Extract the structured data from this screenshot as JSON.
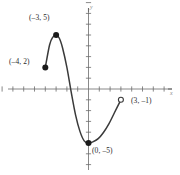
{
  "chart_data": {
    "type": "line",
    "title": "",
    "xlabel": "x",
    "ylabel": "y",
    "grid": false,
    "legend": null,
    "xlim": [
      -8,
      7
    ],
    "ylim": [
      -7,
      8
    ],
    "xticks": [
      -8,
      -7,
      -6,
      -5,
      -4,
      -3,
      -2,
      -1,
      0,
      1,
      2,
      3,
      4,
      5,
      6,
      7
    ],
    "yticks": [
      -7,
      -6,
      -5,
      -4,
      -3,
      -2,
      -1,
      0,
      1,
      2,
      3,
      4,
      5,
      6,
      7,
      8
    ],
    "tick_labels_shown": false,
    "curve_color": "#3a3a3a",
    "axis_color": "#6b6b6b",
    "domain": [
      -4,
      3
    ],
    "curve_points": [
      [
        -4.0,
        2.0
      ],
      [
        -3.6,
        4.1
      ],
      [
        -3.3,
        4.8
      ],
      [
        -3.0,
        5.0
      ],
      [
        -2.7,
        4.7
      ],
      [
        -2.4,
        3.8
      ],
      [
        -2.0,
        2.0
      ],
      [
        -1.6,
        -0.3
      ],
      [
        -1.2,
        -2.4
      ],
      [
        -0.8,
        -3.9
      ],
      [
        -0.4,
        -4.8
      ],
      [
        0.0,
        -5.0
      ],
      [
        0.4,
        -4.9
      ],
      [
        0.9,
        -4.6
      ],
      [
        1.4,
        -4.0
      ],
      [
        1.9,
        -3.2
      ],
      [
        2.4,
        -2.2
      ],
      [
        3.0,
        -1.0
      ]
    ],
    "points": [
      {
        "name": "left-endpoint",
        "x": -4,
        "y": 2,
        "marker": "filled",
        "label": "(–4, 2)",
        "label_side": "left"
      },
      {
        "name": "local-maximum",
        "x": -3,
        "y": 5,
        "marker": "filled",
        "label": "(–3, 5)",
        "label_side": "upper-left"
      },
      {
        "name": "local-minimum",
        "x": 0,
        "y": -5,
        "marker": "filled",
        "label": "(0, –5)",
        "label_side": "right"
      },
      {
        "name": "right-endpoint",
        "x": 3,
        "y": -1,
        "marker": "open",
        "label": "(3, –1)",
        "label_side": "right"
      }
    ]
  },
  "labels": {
    "y_axis": "y",
    "x_axis": "x",
    "point_max": "(–3, 5)",
    "point_left": "(–4, 2)",
    "point_min": "(0, –5)",
    "point_right": "(3, –1)"
  }
}
